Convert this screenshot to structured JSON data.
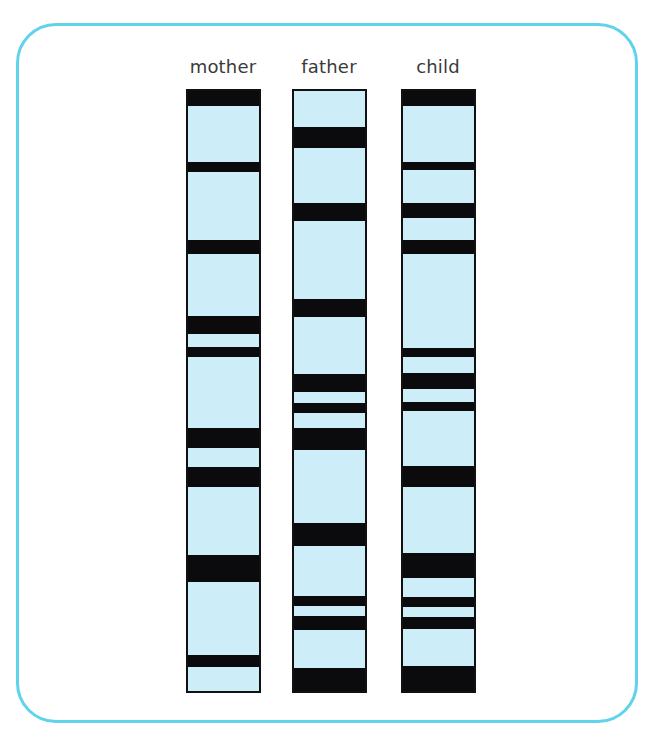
{
  "colors": {
    "frame": "#5fd3ec",
    "lane_fill": "#cdeef8",
    "band": "#0b0b0d",
    "label": "#3a3a3a"
  },
  "lane_top_px": 89,
  "lane_height_px": 604,
  "lanes": [
    {
      "id": "mother",
      "label": "mother",
      "left_px": 186,
      "bands": [
        [
          89,
          106
        ],
        [
          162,
          172
        ],
        [
          240,
          254
        ],
        [
          316,
          334
        ],
        [
          347,
          357
        ],
        [
          428,
          448
        ],
        [
          467,
          487
        ],
        [
          555,
          582
        ],
        [
          655,
          667
        ]
      ]
    },
    {
      "id": "father",
      "label": "father",
      "left_px": 292,
      "bands": [
        [
          127,
          148
        ],
        [
          203,
          221
        ],
        [
          299,
          317
        ],
        [
          374,
          392
        ],
        [
          403,
          413
        ],
        [
          428,
          450
        ],
        [
          523,
          546
        ],
        [
          596,
          606
        ],
        [
          616,
          630
        ],
        [
          668,
          693
        ]
      ]
    },
    {
      "id": "child",
      "label": "child",
      "left_px": 401,
      "bands": [
        [
          89,
          106
        ],
        [
          162,
          170
        ],
        [
          203,
          218
        ],
        [
          240,
          254
        ],
        [
          348,
          357
        ],
        [
          373,
          389
        ],
        [
          402,
          411
        ],
        [
          466,
          487
        ],
        [
          553,
          578
        ],
        [
          597,
          607
        ],
        [
          617,
          629
        ],
        [
          666,
          693
        ]
      ]
    }
  ]
}
